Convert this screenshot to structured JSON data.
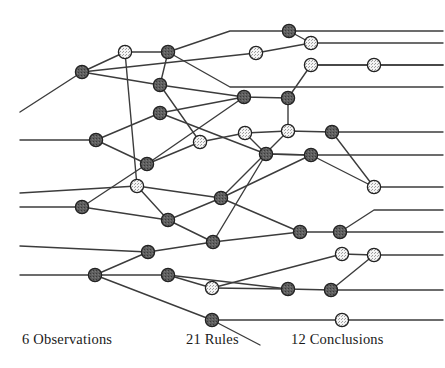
{
  "figure": {
    "background_color": "#ffffff",
    "line_color": "#3c3c3c",
    "line_width": 1.4,
    "node_radius": 6.6,
    "node_stroke_color": "#222222",
    "node_fill_dark": "#5a5a5a",
    "node_fill_light": "#f2f2f2",
    "node_speckle_color": "#8a8a8a"
  },
  "captions": {
    "observations": "6 Observations",
    "rules": "21 Rules",
    "conclusions": "12 Conclusions"
  },
  "counts": {
    "observations": 6,
    "rules": 21,
    "conclusions": 12
  },
  "graph": {
    "nodes": [
      {
        "id": "n1",
        "x": 125,
        "y": 52,
        "type": "light"
      },
      {
        "id": "n2",
        "x": 168,
        "y": 52,
        "type": "dark"
      },
      {
        "id": "n3",
        "x": 82,
        "y": 72,
        "type": "dark"
      },
      {
        "id": "n4",
        "x": 289,
        "y": 31,
        "type": "dark"
      },
      {
        "id": "n5",
        "x": 311,
        "y": 43,
        "type": "light"
      },
      {
        "id": "n6",
        "x": 256,
        "y": 53,
        "type": "light"
      },
      {
        "id": "n7",
        "x": 160,
        "y": 85,
        "type": "dark"
      },
      {
        "id": "n8",
        "x": 311,
        "y": 65,
        "type": "light"
      },
      {
        "id": "n9",
        "x": 374,
        "y": 65,
        "type": "light"
      },
      {
        "id": "n10",
        "x": 244,
        "y": 97,
        "type": "dark"
      },
      {
        "id": "n11",
        "x": 288,
        "y": 98,
        "type": "dark"
      },
      {
        "id": "n12",
        "x": 160,
        "y": 113,
        "type": "dark"
      },
      {
        "id": "n13",
        "x": 96,
        "y": 140,
        "type": "dark"
      },
      {
        "id": "n14",
        "x": 200,
        "y": 142,
        "type": "light"
      },
      {
        "id": "n15",
        "x": 245,
        "y": 133,
        "type": "light"
      },
      {
        "id": "n16",
        "x": 288,
        "y": 131,
        "type": "light"
      },
      {
        "id": "n17",
        "x": 332,
        "y": 132,
        "type": "dark"
      },
      {
        "id": "n18",
        "x": 147,
        "y": 164,
        "type": "dark"
      },
      {
        "id": "n19",
        "x": 266,
        "y": 154,
        "type": "dark"
      },
      {
        "id": "n20",
        "x": 311,
        "y": 155,
        "type": "dark"
      },
      {
        "id": "n21",
        "x": 137,
        "y": 186,
        "type": "light"
      },
      {
        "id": "n22",
        "x": 374,
        "y": 187,
        "type": "light"
      },
      {
        "id": "n23",
        "x": 82,
        "y": 207,
        "type": "dark"
      },
      {
        "id": "n24",
        "x": 221,
        "y": 198,
        "type": "dark"
      },
      {
        "id": "n25",
        "x": 168,
        "y": 220,
        "type": "dark"
      },
      {
        "id": "n26",
        "x": 213,
        "y": 242,
        "type": "dark"
      },
      {
        "id": "n27",
        "x": 148,
        "y": 252,
        "type": "dark"
      },
      {
        "id": "n28",
        "x": 300,
        "y": 232,
        "type": "dark"
      },
      {
        "id": "n29",
        "x": 340,
        "y": 232,
        "type": "dark"
      },
      {
        "id": "n30",
        "x": 95,
        "y": 275,
        "type": "dark"
      },
      {
        "id": "n31",
        "x": 168,
        "y": 275,
        "type": "dark"
      },
      {
        "id": "n32",
        "x": 342,
        "y": 254,
        "type": "light"
      },
      {
        "id": "n33",
        "x": 374,
        "y": 255,
        "type": "light"
      },
      {
        "id": "n34",
        "x": 212,
        "y": 288,
        "type": "light"
      },
      {
        "id": "n35",
        "x": 288,
        "y": 289,
        "type": "dark"
      },
      {
        "id": "n36",
        "x": 331,
        "y": 290,
        "type": "dark"
      },
      {
        "id": "n37",
        "x": 212,
        "y": 320,
        "type": "dark"
      },
      {
        "id": "n38",
        "x": 342,
        "y": 320,
        "type": "light"
      }
    ],
    "polylines": [
      [
        [
          20,
          112
        ],
        [
          82,
          72
        ],
        [
          125,
          52
        ],
        [
          168,
          52
        ],
        [
          230,
          31
        ],
        [
          289,
          31
        ],
        [
          443,
          31
        ]
      ],
      [
        [
          289,
          31
        ],
        [
          311,
          43
        ],
        [
          443,
          43
        ]
      ],
      [
        [
          82,
          72
        ],
        [
          256,
          53
        ],
        [
          311,
          43
        ]
      ],
      [
        [
          82,
          72
        ],
        [
          160,
          85
        ],
        [
          244,
          97
        ],
        [
          288,
          98
        ],
        [
          311,
          65
        ],
        [
          443,
          65
        ]
      ],
      [
        [
          311,
          65
        ],
        [
          374,
          65
        ],
        [
          443,
          65
        ]
      ],
      [
        [
          168,
          52
        ],
        [
          160,
          85
        ]
      ],
      [
        [
          168,
          52
        ],
        [
          230,
          87
        ],
        [
          443,
          87
        ]
      ],
      [
        [
          125,
          52
        ],
        [
          137,
          186
        ]
      ],
      [
        [
          160,
          85
        ],
        [
          200,
          142
        ]
      ],
      [
        [
          20,
          140
        ],
        [
          96,
          140
        ],
        [
          160,
          113
        ],
        [
          244,
          97
        ]
      ],
      [
        [
          96,
          140
        ],
        [
          147,
          164
        ],
        [
          200,
          142
        ],
        [
          245,
          133
        ],
        [
          288,
          131
        ],
        [
          332,
          132
        ],
        [
          443,
          132
        ]
      ],
      [
        [
          245,
          133
        ],
        [
          266,
          154
        ],
        [
          311,
          155
        ],
        [
          443,
          155
        ]
      ],
      [
        [
          160,
          113
        ],
        [
          266,
          154
        ]
      ],
      [
        [
          288,
          98
        ],
        [
          288,
          131
        ]
      ],
      [
        [
          332,
          132
        ],
        [
          374,
          187
        ],
        [
          443,
          187
        ]
      ],
      [
        [
          20,
          193
        ],
        [
          137,
          186
        ],
        [
          221,
          198
        ],
        [
          288,
          131
        ]
      ],
      [
        [
          137,
          186
        ],
        [
          168,
          220
        ]
      ],
      [
        [
          20,
          207
        ],
        [
          82,
          207
        ],
        [
          147,
          164
        ]
      ],
      [
        [
          82,
          207
        ],
        [
          168,
          220
        ],
        [
          221,
          198
        ],
        [
          300,
          232
        ],
        [
          340,
          232
        ],
        [
          443,
          232
        ]
      ],
      [
        [
          168,
          220
        ],
        [
          213,
          242
        ],
        [
          300,
          232
        ]
      ],
      [
        [
          340,
          232
        ],
        [
          374,
          210
        ],
        [
          443,
          210
        ]
      ],
      [
        [
          20,
          246
        ],
        [
          148,
          252
        ],
        [
          213,
          242
        ]
      ],
      [
        [
          148,
          252
        ],
        [
          95,
          275
        ]
      ],
      [
        [
          20,
          275
        ],
        [
          95,
          275
        ],
        [
          168,
          275
        ],
        [
          288,
          289
        ],
        [
          331,
          290
        ],
        [
          443,
          290
        ]
      ],
      [
        [
          95,
          275
        ],
        [
          212,
          320
        ],
        [
          342,
          320
        ],
        [
          443,
          320
        ]
      ],
      [
        [
          168,
          275
        ],
        [
          212,
          288
        ],
        [
          342,
          254
        ],
        [
          374,
          255
        ],
        [
          443,
          255
        ]
      ],
      [
        [
          212,
          288
        ],
        [
          288,
          289
        ]
      ],
      [
        [
          266,
          154
        ],
        [
          311,
          155
        ]
      ],
      [
        [
          311,
          155
        ],
        [
          374,
          187
        ]
      ],
      [
        [
          374,
          255
        ],
        [
          331,
          290
        ]
      ],
      [
        [
          213,
          242
        ],
        [
          266,
          154
        ]
      ],
      [
        [
          221,
          198
        ],
        [
          311,
          155
        ]
      ],
      [
        [
          147,
          164
        ],
        [
          244,
          97
        ]
      ],
      [
        [
          212,
          320
        ],
        [
          260,
          345
        ]
      ]
    ]
  }
}
